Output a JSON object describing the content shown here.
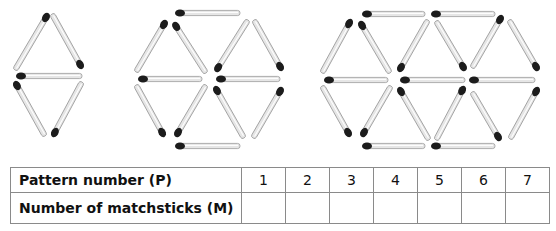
{
  "figure": {
    "patterns": [
      {
        "name": "pattern-1",
        "matchsticks": [
          {
            "x1": 48,
            "y1": 14,
            "x2": 15,
            "y2": 70,
            "head": "start"
          },
          {
            "x1": 52,
            "y1": 14,
            "x2": 82,
            "y2": 68,
            "head": "end"
          },
          {
            "x1": 17,
            "y1": 76,
            "x2": 82,
            "y2": 76,
            "head": "start"
          },
          {
            "x1": 15,
            "y1": 82,
            "x2": 45,
            "y2": 136,
            "head": "start"
          },
          {
            "x1": 82,
            "y1": 82,
            "x2": 53,
            "y2": 136,
            "head": "end"
          }
        ]
      },
      {
        "name": "pattern-2",
        "matchsticks": [
          {
            "x1": 176,
            "y1": 13,
            "x2": 240,
            "y2": 13,
            "head": "start"
          },
          {
            "x1": 166,
            "y1": 21,
            "x2": 136,
            "y2": 72,
            "head": "start"
          },
          {
            "x1": 174,
            "y1": 23,
            "x2": 206,
            "y2": 73,
            "head": "start"
          },
          {
            "x1": 248,
            "y1": 20,
            "x2": 216,
            "y2": 71,
            "head": "end"
          },
          {
            "x1": 254,
            "y1": 20,
            "x2": 282,
            "y2": 70,
            "head": "end"
          },
          {
            "x1": 139,
            "y1": 79,
            "x2": 202,
            "y2": 79,
            "head": "start"
          },
          {
            "x1": 217,
            "y1": 79,
            "x2": 280,
            "y2": 79,
            "head": "start"
          },
          {
            "x1": 136,
            "y1": 85,
            "x2": 164,
            "y2": 136,
            "head": "end"
          },
          {
            "x1": 206,
            "y1": 85,
            "x2": 176,
            "y2": 136,
            "head": "end"
          },
          {
            "x1": 215,
            "y1": 87,
            "x2": 244,
            "y2": 138,
            "head": "start"
          },
          {
            "x1": 282,
            "y1": 88,
            "x2": 253,
            "y2": 138,
            "head": "start"
          },
          {
            "x1": 176,
            "y1": 146,
            "x2": 240,
            "y2": 146,
            "head": "start"
          }
        ]
      },
      {
        "name": "pattern-3",
        "matchsticks": [
          {
            "x1": 363,
            "y1": 14,
            "x2": 425,
            "y2": 14,
            "head": "start"
          },
          {
            "x1": 432,
            "y1": 14,
            "x2": 495,
            "y2": 14,
            "head": "start"
          },
          {
            "x1": 351,
            "y1": 20,
            "x2": 322,
            "y2": 73,
            "head": "start"
          },
          {
            "x1": 360,
            "y1": 22,
            "x2": 390,
            "y2": 73,
            "head": "start"
          },
          {
            "x1": 428,
            "y1": 20,
            "x2": 399,
            "y2": 71,
            "head": "end"
          },
          {
            "x1": 436,
            "y1": 21,
            "x2": 465,
            "y2": 70,
            "head": "end"
          },
          {
            "x1": 502,
            "y1": 16,
            "x2": 472,
            "y2": 68,
            "head": "start"
          },
          {
            "x1": 509,
            "y1": 20,
            "x2": 538,
            "y2": 70,
            "head": "end"
          },
          {
            "x1": 325,
            "y1": 80,
            "x2": 388,
            "y2": 80,
            "head": "start"
          },
          {
            "x1": 401,
            "y1": 80,
            "x2": 465,
            "y2": 80,
            "head": "start"
          },
          {
            "x1": 470,
            "y1": 80,
            "x2": 535,
            "y2": 80,
            "head": "start"
          },
          {
            "x1": 322,
            "y1": 86,
            "x2": 350,
            "y2": 136,
            "head": "end"
          },
          {
            "x1": 391,
            "y1": 86,
            "x2": 362,
            "y2": 136,
            "head": "end"
          },
          {
            "x1": 399,
            "y1": 88,
            "x2": 429,
            "y2": 140,
            "head": "start"
          },
          {
            "x1": 464,
            "y1": 87,
            "x2": 436,
            "y2": 140,
            "head": "start"
          },
          {
            "x1": 472,
            "y1": 92,
            "x2": 500,
            "y2": 140,
            "head": "end"
          },
          {
            "x1": 538,
            "y1": 88,
            "x2": 510,
            "y2": 139,
            "head": "start"
          },
          {
            "x1": 363,
            "y1": 146,
            "x2": 425,
            "y2": 146,
            "head": "start"
          },
          {
            "x1": 432,
            "y1": 146,
            "x2": 495,
            "y2": 146,
            "head": "start"
          }
        ]
      }
    ],
    "colors": {
      "stick_fill": "#e6e6e6",
      "stick_stroke": "#9a9a9a",
      "head": "#1c1c1c"
    }
  },
  "table": {
    "rows": [
      {
        "label": "Pattern number (P)",
        "cells": [
          "1",
          "2",
          "3",
          "4",
          "5",
          "6",
          "7"
        ]
      },
      {
        "label": "Number of matchsticks (M)",
        "cells": [
          "",
          "",
          "",
          "",
          "",
          "",
          ""
        ]
      }
    ]
  }
}
